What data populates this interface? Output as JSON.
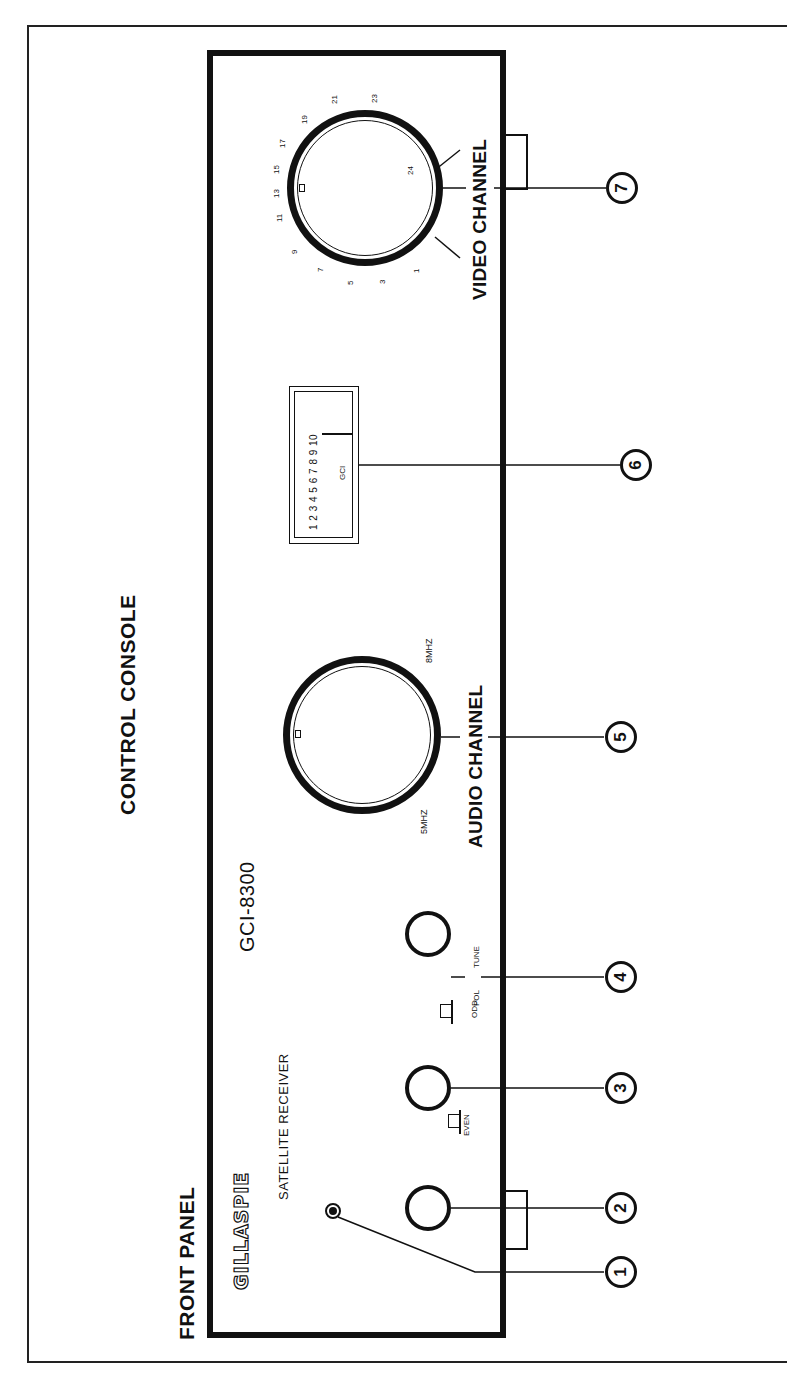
{
  "diagram": {
    "heading_front": "FRONT PANEL",
    "heading_console": "CONTROL CONSOLE",
    "brand": "GILLASPIE",
    "model": "GCI-8300",
    "subtitle": "SATELLITE RECEIVER",
    "controls": {
      "even_label": "EVEN",
      "odd_label": "ODD",
      "pol_label": "POL",
      "tune_label": "TUNE",
      "audio": {
        "label": "AUDIO CHANNEL",
        "min": "5MHZ",
        "max": "8MHZ"
      },
      "meter": {
        "scale": "1 2 3 4 5 6 7 8 9 10",
        "brand": "GCI"
      },
      "video": {
        "label": "VIDEO CHANNEL",
        "ticks": [
          "1",
          "3",
          "5",
          "7",
          "9",
          "11",
          "13",
          "15",
          "17",
          "19",
          "21",
          "23",
          "24"
        ]
      }
    },
    "callouts": [
      "1",
      "2",
      "3",
      "4",
      "5",
      "6",
      "7"
    ]
  }
}
